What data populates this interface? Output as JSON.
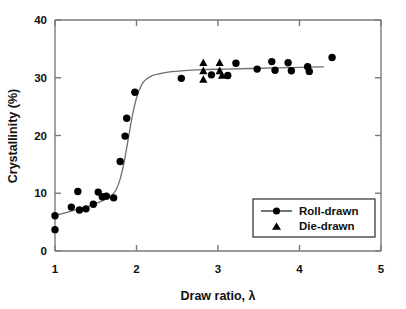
{
  "chart_data": {
    "type": "scatter",
    "title": "",
    "xlabel": "Draw ratio, λ",
    "ylabel": "Crystallinity (%)",
    "xlim": [
      1,
      5
    ],
    "ylim": [
      0,
      40
    ],
    "xticks": [
      1,
      2,
      3,
      4,
      5
    ],
    "yticks": [
      0,
      10,
      20,
      30,
      40
    ],
    "xticklabels": [
      "1",
      "2",
      "3",
      "4",
      "5"
    ],
    "yticklabels": [
      "0",
      "10",
      "20",
      "30",
      "40"
    ],
    "grid": false,
    "legend_position": "lower-right",
    "series": [
      {
        "name": "Roll-drawn",
        "marker": "circle",
        "has_line": true,
        "points": [
          [
            1.0,
            6.1
          ],
          [
            1.0,
            3.7
          ],
          [
            1.2,
            7.6
          ],
          [
            1.28,
            10.3
          ],
          [
            1.3,
            7.1
          ],
          [
            1.38,
            7.3
          ],
          [
            1.47,
            8.1
          ],
          [
            1.53,
            10.2
          ],
          [
            1.58,
            9.4
          ],
          [
            1.63,
            9.5
          ],
          [
            1.72,
            9.2
          ],
          [
            1.8,
            15.5
          ],
          [
            1.86,
            19.9
          ],
          [
            1.88,
            23.0
          ],
          [
            1.98,
            27.5
          ],
          [
            2.55,
            29.9
          ],
          [
            2.92,
            30.5
          ],
          [
            3.12,
            30.4
          ],
          [
            3.22,
            32.5
          ],
          [
            3.48,
            31.5
          ],
          [
            3.66,
            32.8
          ],
          [
            3.7,
            31.3
          ],
          [
            3.86,
            32.6
          ],
          [
            3.9,
            31.2
          ],
          [
            4.1,
            31.9
          ],
          [
            4.12,
            31.1
          ],
          [
            4.4,
            33.5
          ]
        ]
      },
      {
        "name": "Die-drawn",
        "marker": "triangle",
        "has_line": false,
        "points": [
          [
            2.82,
            32.6
          ],
          [
            2.82,
            31.2
          ],
          [
            2.82,
            29.7
          ],
          [
            3.02,
            32.6
          ],
          [
            3.02,
            31.2
          ],
          [
            3.05,
            30.4
          ]
        ]
      }
    ],
    "fit_curve": {
      "description": "sigmoidal fit through roll-drawn data",
      "points": [
        [
          1.0,
          6.2
        ],
        [
          1.1,
          6.5
        ],
        [
          1.2,
          6.9
        ],
        [
          1.3,
          7.3
        ],
        [
          1.4,
          7.7
        ],
        [
          1.5,
          8.2
        ],
        [
          1.6,
          8.8
        ],
        [
          1.7,
          9.7
        ],
        [
          1.75,
          10.6
        ],
        [
          1.8,
          12.5
        ],
        [
          1.85,
          15.5
        ],
        [
          1.9,
          19.5
        ],
        [
          1.95,
          23.5
        ],
        [
          2.0,
          26.5
        ],
        [
          2.05,
          28.4
        ],
        [
          2.1,
          29.5
        ],
        [
          2.2,
          30.4
        ],
        [
          2.35,
          30.9
        ],
        [
          2.55,
          31.2
        ],
        [
          2.8,
          31.4
        ],
        [
          3.1,
          31.5
        ],
        [
          3.4,
          31.6
        ],
        [
          3.7,
          31.7
        ],
        [
          4.0,
          31.8
        ],
        [
          4.3,
          31.9
        ]
      ]
    }
  },
  "legend": {
    "items": [
      {
        "label": "Roll-drawn",
        "marker": "circle"
      },
      {
        "label": "Die-drawn",
        "marker": "triangle"
      }
    ]
  }
}
